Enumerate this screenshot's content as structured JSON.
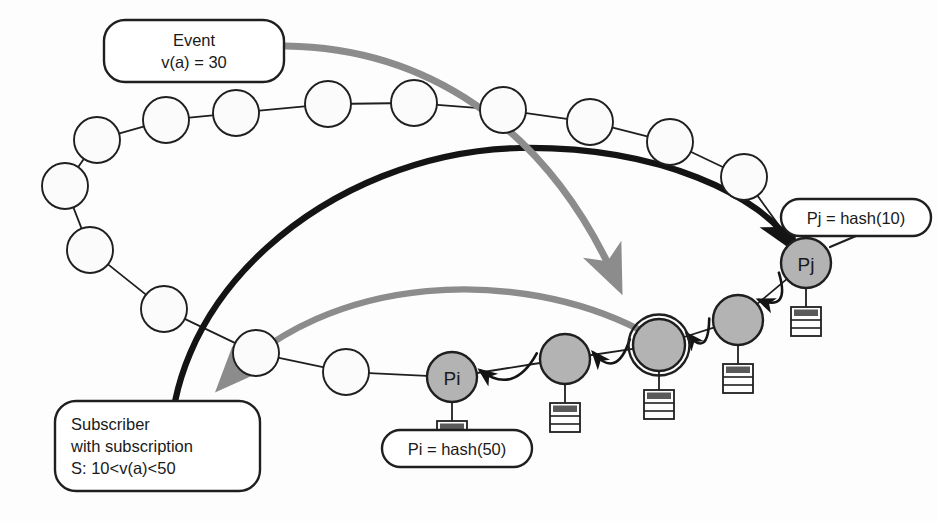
{
  "diagram": {
    "colors": {
      "background": "#fdfdfd",
      "ring_stroke": "#1f1f1f",
      "white_node_fill": "#fbfbfb",
      "gray_node_fill": "#b3b3b3",
      "gray_node_stroke": "#1f1f1f",
      "gray_arrow": "#8c8c8c",
      "black_arrow": "#141414",
      "server_icon_band": "#5a5a5a",
      "server_icon_fill": "#fefefe"
    },
    "callouts": [
      {
        "id": "event",
        "name": "event-callout",
        "lines": [
          "Event",
          "v(a) = 30"
        ],
        "x": 104,
        "y": 20,
        "w": 180,
        "h": 62,
        "align": "center"
      },
      {
        "id": "subscriber",
        "name": "subscriber-callout",
        "lines": [
          "Subscriber",
          "with subscription",
          "S: 10<v(a)<50"
        ],
        "x": 55,
        "y": 401,
        "w": 205,
        "h": 90,
        "align": "left"
      },
      {
        "id": "pj-hash",
        "name": "pj-hash-callout",
        "lines": [
          "Pj = hash(10)"
        ],
        "x": 781,
        "y": 199,
        "w": 150,
        "h": 37,
        "align": "center"
      },
      {
        "id": "pi-hash",
        "name": "pi-hash-callout",
        "lines": [
          "Pi = hash(50)"
        ],
        "x": 382,
        "y": 430,
        "w": 150,
        "h": 37,
        "align": "center"
      }
    ],
    "ring_nodes": [
      {
        "id": "n01",
        "label": "",
        "cx": 236,
        "cy": 113,
        "r": 23,
        "kind": "white"
      },
      {
        "id": "n02",
        "label": "",
        "cx": 328,
        "cy": 104,
        "r": 23,
        "kind": "white"
      },
      {
        "id": "n03",
        "label": "",
        "cx": 414,
        "cy": 103,
        "r": 23,
        "kind": "white"
      },
      {
        "id": "n04",
        "label": "",
        "cx": 503,
        "cy": 110,
        "r": 23,
        "kind": "white"
      },
      {
        "id": "n05",
        "label": "",
        "cx": 590,
        "cy": 122,
        "r": 23,
        "kind": "white"
      },
      {
        "id": "n06",
        "label": "",
        "cx": 670,
        "cy": 142,
        "r": 23,
        "kind": "white"
      },
      {
        "id": "n07",
        "label": "",
        "cx": 744,
        "cy": 177,
        "r": 23,
        "kind": "white"
      },
      {
        "id": "n08",
        "label": "Pj",
        "cx": 806,
        "cy": 263,
        "r": 25,
        "kind": "gray"
      },
      {
        "id": "n09",
        "label": "",
        "cx": 738,
        "cy": 320,
        "r": 25,
        "kind": "gray"
      },
      {
        "id": "n10",
        "label": "",
        "cx": 659,
        "cy": 345,
        "r": 26,
        "kind": "gray-ringed"
      },
      {
        "id": "n11",
        "label": "",
        "cx": 565,
        "cy": 359,
        "r": 25,
        "kind": "gray"
      },
      {
        "id": "n12",
        "label": "Pi",
        "cx": 452,
        "cy": 377,
        "r": 25,
        "kind": "gray"
      },
      {
        "id": "n13",
        "label": "",
        "cx": 346,
        "cy": 372,
        "r": 23,
        "kind": "white"
      },
      {
        "id": "n14",
        "label": "",
        "cx": 256,
        "cy": 353,
        "r": 23,
        "kind": "white"
      },
      {
        "id": "n15",
        "label": "",
        "cx": 164,
        "cy": 309,
        "r": 23,
        "kind": "white"
      },
      {
        "id": "n16",
        "label": "",
        "cx": 90,
        "cy": 250,
        "r": 23,
        "kind": "white"
      },
      {
        "id": "n17",
        "label": "",
        "cx": 65,
        "cy": 186,
        "r": 23,
        "kind": "white"
      },
      {
        "id": "n18",
        "label": "",
        "cx": 97,
        "cy": 140,
        "r": 23,
        "kind": "white"
      },
      {
        "id": "n19",
        "label": "",
        "cx": 166,
        "cy": 120,
        "r": 23,
        "kind": "white"
      }
    ],
    "server_icons": [
      {
        "for": "n08",
        "x": 806,
        "y": 307
      },
      {
        "for": "n09",
        "x": 738,
        "y": 364
      },
      {
        "for": "n10",
        "x": 659,
        "y": 390
      },
      {
        "for": "n11",
        "x": 565,
        "y": 403
      },
      {
        "for": "n12",
        "x": 452,
        "y": 421
      }
    ],
    "hop_arrows": [
      {
        "from": "n08",
        "to": "n09",
        "name": "hop-arrow-pj-to-n09"
      },
      {
        "from": "n09",
        "to": "n10",
        "name": "hop-arrow-n09-to-n10"
      },
      {
        "from": "n10",
        "to": "n11",
        "name": "hop-arrow-n10-to-n11"
      },
      {
        "from": "n11",
        "to": "n12",
        "name": "hop-arrow-n11-to-pi"
      }
    ],
    "flows": [
      {
        "id": "event-to-pj",
        "name": "black-publish-arc",
        "style": "black-thick",
        "description": "Subscriber publishes / routes to Pj"
      },
      {
        "id": "event-to-rendezvous",
        "name": "gray-event-arrow",
        "style": "gray-thick",
        "description": "Event v(a)=30 routed to rendezvous node"
      },
      {
        "id": "notify-subscriber",
        "name": "gray-notify-arrow",
        "style": "gray-thick",
        "description": "Notification delivered back to subscriber"
      }
    ]
  }
}
